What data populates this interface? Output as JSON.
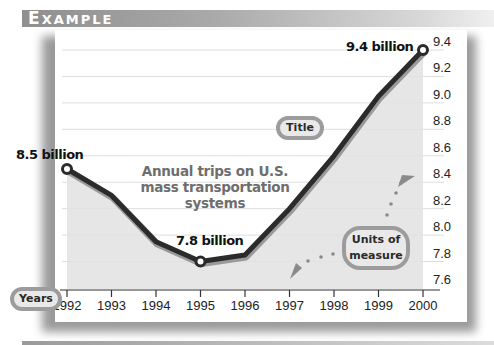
{
  "header": {
    "first_letter": "E",
    "rest": "XAMPLE",
    "label": "EXAMPLE"
  },
  "callouts": {
    "title_tag": "Title",
    "years_tag": "Years",
    "units_tag_line1": "Units of",
    "units_tag_line2": "measure"
  },
  "annotations": {
    "start": "8.5 billion",
    "min": "7.8 billion",
    "end": "9.4 billion"
  },
  "chart_title_lines": [
    "Annual trips on U.S.",
    "mass transportation",
    "systems"
  ],
  "colors": {
    "line": "#2b2b2b",
    "fill": "#e2e2e2",
    "header_gradient_start": "#8f8f8f",
    "callout_border": "#9c9c9c",
    "title_text": "#6e6e6e"
  },
  "axis": {
    "x_ticks": [
      "1992",
      "1993",
      "1994",
      "1995",
      "1996",
      "1997",
      "1998",
      "1999",
      "2000"
    ],
    "y_ticks": [
      "9.4",
      "9.2",
      "9.0",
      "8.8",
      "8.6",
      "8.4",
      "8.2",
      "8.0",
      "7.8",
      "7.6"
    ]
  },
  "chart_data": {
    "type": "line",
    "title": "Annual trips on U.S. mass transportation systems",
    "xlabel": "Years",
    "ylabel": "Units of measure (billions)",
    "categories": [
      "1992",
      "1993",
      "1994",
      "1995",
      "1996",
      "1997",
      "1998",
      "1999",
      "2000"
    ],
    "series": [
      {
        "name": "Annual trips (billions)",
        "values": [
          8.5,
          8.3,
          7.95,
          7.8,
          7.85,
          8.2,
          8.6,
          9.05,
          9.4
        ]
      }
    ],
    "annotations": [
      {
        "x": "1992",
        "text": "8.5 billion"
      },
      {
        "x": "1995",
        "text": "7.8 billion"
      },
      {
        "x": "2000",
        "text": "9.4 billion"
      }
    ],
    "ylim": [
      7.6,
      9.4
    ],
    "y_tick_step": 0.2,
    "grid": true,
    "legend": "none",
    "area_fill": true
  }
}
